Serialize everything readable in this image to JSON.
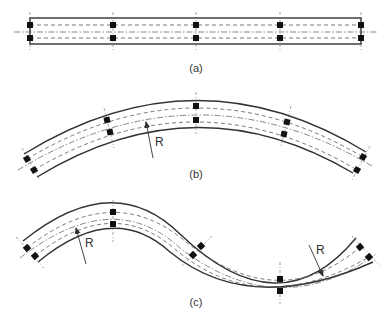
{
  "figure": {
    "panels": [
      {
        "id": "a",
        "label": "(a)",
        "shape": "straight beam",
        "sections": 5
      },
      {
        "id": "b",
        "label": "(b)",
        "shape": "single arc beam",
        "sections": 5,
        "radius_label": "R"
      },
      {
        "id": "c",
        "label": "(c)",
        "shape": "S-curve beam",
        "sections": 5,
        "radius_labels": [
          "R",
          "R"
        ]
      }
    ],
    "colors": {
      "outline": "#333333",
      "dashed": "#555555",
      "marker": "#111111",
      "background": "#ffffff"
    }
  }
}
